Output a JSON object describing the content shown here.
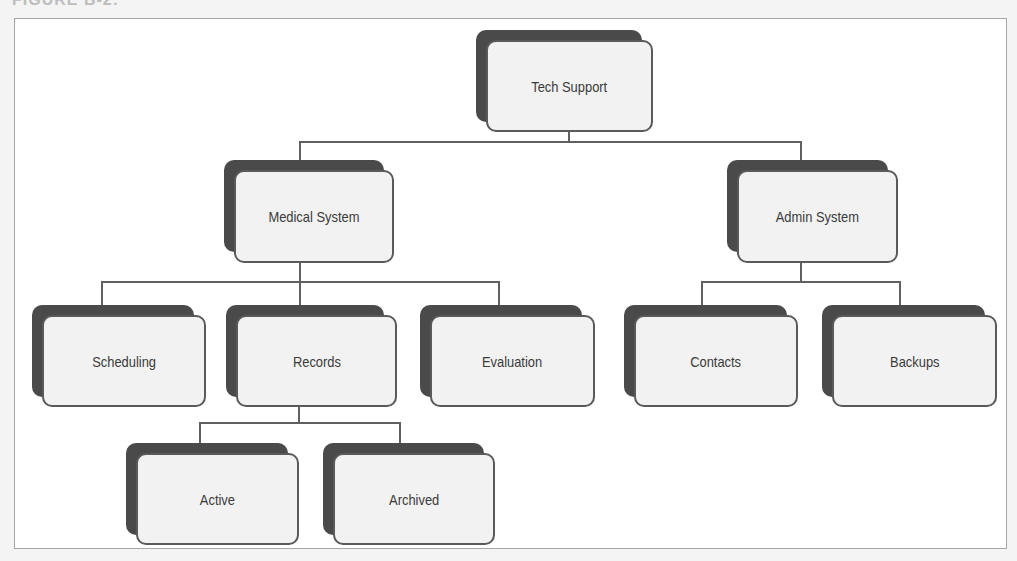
{
  "figure": {
    "label": "FIGURE B-2:"
  },
  "colors": {
    "frame_border": "#a6a6a6",
    "background": "#ffffff",
    "node_fill": "#f2f2f2",
    "node_border": "#5a5a5a",
    "node_shadow": "#4a4a4a",
    "connector": "#606060",
    "text": "#3a3a3a"
  },
  "tree": {
    "root": {
      "label": "Tech Support",
      "children": [
        {
          "label": "Medical System",
          "children": [
            {
              "label": "Scheduling"
            },
            {
              "label": "Records",
              "children": [
                {
                  "label": "Active"
                },
                {
                  "label": "Archived"
                }
              ]
            },
            {
              "label": "Evaluation"
            }
          ]
        },
        {
          "label": "Admin System",
          "children": [
            {
              "label": "Contacts"
            },
            {
              "label": "Backups"
            }
          ]
        }
      ]
    }
  },
  "nodes": {
    "tech_support": "Tech Support",
    "medical_system": "Medical System",
    "admin_system": "Admin System",
    "scheduling": "Scheduling",
    "records": "Records",
    "evaluation": "Evaluation",
    "contacts": "Contacts",
    "backups": "Backups",
    "active": "Active",
    "archived": "Archived"
  }
}
